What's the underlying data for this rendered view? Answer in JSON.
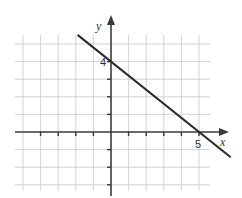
{
  "chart_data": {
    "type": "line",
    "title": "",
    "xlabel": "x",
    "ylabel": "y",
    "xlim": [
      -5,
      5
    ],
    "ylim": [
      -3,
      5
    ],
    "grid": true,
    "grid_step": 1,
    "tick_labels": [
      {
        "axis": "y",
        "value": 4,
        "text": "4"
      },
      {
        "axis": "x",
        "value": 5,
        "text": "5"
      }
    ],
    "series": [
      {
        "name": "line",
        "equation": "y = -0.8x + 4",
        "slope": -0.8,
        "intercept": 4,
        "x_range": [
          -1.9,
          6.8
        ],
        "points": [
          {
            "x": 0,
            "y": 4
          },
          {
            "x": 5,
            "y": 0
          }
        ]
      }
    ]
  }
}
